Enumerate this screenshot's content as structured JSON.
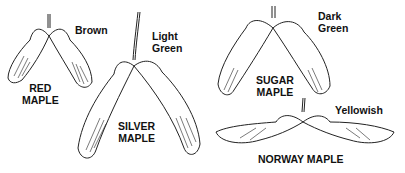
{
  "species": [
    {
      "name_line1": "RED",
      "name_line2": "MAPLE",
      "color_line1": "Brown",
      "color_line2": ""
    },
    {
      "name_line1": "SILVER",
      "name_line2": "MAPLE",
      "color_line1": "Light",
      "color_line2": "Green"
    },
    {
      "name_line1": "SUGAR",
      "name_line2": "MAPLE",
      "color_line1": "Dark",
      "color_line2": "Green"
    },
    {
      "name_line1": "NORWAY MAPLE",
      "name_line2": "",
      "color_line1": "Yellowish",
      "color_line2": ""
    }
  ]
}
